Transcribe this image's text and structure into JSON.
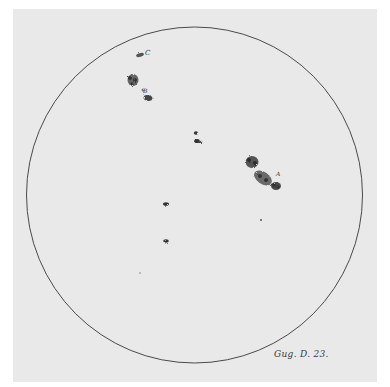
{
  "image": {
    "subject": "Sunspot drawing on solar disk",
    "caption": "Gug. D. 23.",
    "colors": {
      "paper": "#e9e9e9",
      "border": "#ffffff",
      "outline": "#4a4a4a",
      "spots": "#5a5a5a"
    }
  },
  "disk": {
    "cx": 194.5,
    "cy": 195,
    "r": 168
  },
  "spot_labels": [
    {
      "text": "C",
      "x": 146,
      "y": 54
    },
    {
      "text": "B",
      "x": 144,
      "y": 92
    },
    {
      "text": "A",
      "x": 276,
      "y": 176
    }
  ]
}
